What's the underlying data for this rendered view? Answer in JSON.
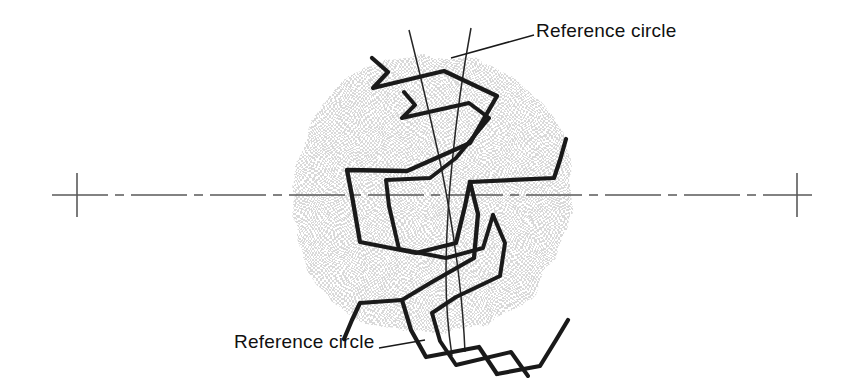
{
  "figure": {
    "type": "engineering-drawing",
    "background_color": "#ffffff",
    "blob": {
      "name": "gear-body-shading",
      "fill_color": "#e6e6e6",
      "description": "light gray irregular mottled blob representing the gear blank body"
    },
    "centerline": {
      "name": "horizontal-centerline",
      "color": "#555555",
      "style": "dash-dot",
      "y": 195,
      "x_start": 52,
      "x_end": 812
    },
    "crosshairs": [
      {
        "name": "left-crosshair",
        "x": 77,
        "y": 195,
        "half_size": 22
      },
      {
        "name": "right-crosshair",
        "x": 797,
        "y": 195,
        "half_size": 22
      }
    ],
    "tooth_profiles": {
      "name": "gear-tooth-profiles",
      "stroke_color": "#1a1a1a",
      "count": 2,
      "description": "two overlapping heavy zigzag polylines showing tooth flank deviation"
    },
    "reference_circles": {
      "name": "reference-circle-arcs",
      "stroke_color": "#222222",
      "count": 2,
      "description": "two thin near-vertical arcs crossing the tooth profiles"
    }
  },
  "labels": {
    "top": {
      "text": "Reference circle",
      "leader_from_x": 536,
      "leader_from_y": 35,
      "leader_to_x": 451,
      "leader_to_y": 58
    },
    "bottom": {
      "text": "Reference circle",
      "leader_from_x": 377,
      "leader_from_y": 348,
      "leader_to_x": 424,
      "leader_to_y": 341
    }
  }
}
